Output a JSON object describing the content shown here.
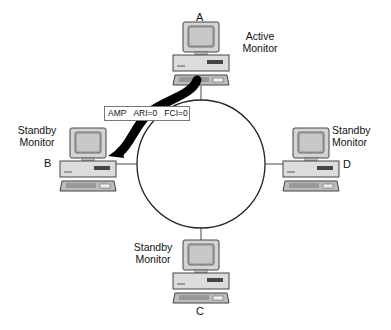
{
  "diagram": {
    "type": "token-ring-network",
    "ring": {
      "cx": 201,
      "cy": 164,
      "r": 64
    },
    "stations": [
      {
        "id": "A",
        "letter": "A",
        "role_line1": "Active",
        "role_line2": "Monitor",
        "x": 170,
        "y": 22
      },
      {
        "id": "B",
        "letter": "B",
        "role_line1": "Standby",
        "role_line2": "Monitor",
        "x": 60,
        "y": 128
      },
      {
        "id": "D",
        "letter": "D",
        "role_line1": "Standby",
        "role_line2": "Monitor",
        "x": 275,
        "y": 128
      },
      {
        "id": "C",
        "letter": "C",
        "role_line1": "Standby",
        "role_line2": "Monitor",
        "x": 168,
        "y": 240
      }
    ],
    "frame": {
      "fields": [
        "AMP",
        "ARI=0",
        "FCI=0"
      ]
    },
    "arrow": {
      "from": "A",
      "to": "B",
      "color": "#000000"
    },
    "colors": {
      "computer_body": "#d9d9d9",
      "computer_outline": "#444444",
      "screen": "#bdbdbd",
      "ring": "#222222"
    }
  }
}
